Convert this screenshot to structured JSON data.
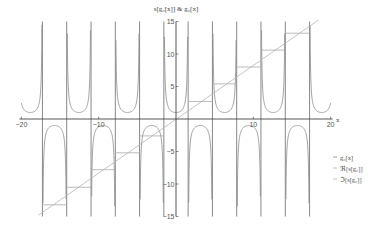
{
  "chart_data": {
    "type": "line",
    "title": "s[g₀[x]] & g₀[x]",
    "xlabel": "x",
    "ylabel": "s[g₀[x]] & g₀[x]",
    "xlim": [
      -20,
      20
    ],
    "ylim": [
      -15,
      15
    ],
    "x_ticks": [
      -20,
      -10,
      10,
      20
    ],
    "x_tick_labels": [
      "−20",
      "−10",
      "10",
      "20"
    ],
    "y_ticks": [
      15,
      10,
      5,
      -5,
      -10,
      -15
    ],
    "y_tick_labels": [
      "15",
      "10",
      "5",
      "−5",
      "−10",
      "−15"
    ],
    "grid": false,
    "legend_position": "right-middle",
    "series": [
      {
        "name": "g₀[x]",
        "description": "sec-like curve with vertical asymptotes at x = π/2 + kπ; alternating U (min ≈ 1) and inverted U (max ≈ -1)",
        "asymptotes": [
          -17.28,
          -14.14,
          -10.99,
          -7.85,
          -4.71,
          -1.57,
          1.57,
          4.71,
          7.85,
          10.99,
          14.14,
          17.28
        ],
        "extrema": [
          {
            "x": -18.85,
            "y": 1
          },
          {
            "x": -15.71,
            "y": -1
          },
          {
            "x": -12.57,
            "y": 1
          },
          {
            "x": -9.42,
            "y": -1
          },
          {
            "x": -6.28,
            "y": 1
          },
          {
            "x": -3.14,
            "y": -1
          },
          {
            "x": 0,
            "y": 1
          },
          {
            "x": 3.14,
            "y": -1
          },
          {
            "x": 6.28,
            "y": 1
          },
          {
            "x": 9.42,
            "y": -1
          },
          {
            "x": 12.57,
            "y": 1
          },
          {
            "x": 15.71,
            "y": -1
          },
          {
            "x": 18.85,
            "y": 1
          }
        ]
      },
      {
        "name": "ℜ[s[g₀]]",
        "description": "staircase, constant between consecutive asymptotes",
        "steps": [
          {
            "x0": -17.28,
            "x1": -14.14,
            "y": -13.2
          },
          {
            "x0": -14.14,
            "x1": -10.99,
            "y": -10.5
          },
          {
            "x0": -10.99,
            "x1": -7.85,
            "y": -7.8
          },
          {
            "x0": -7.85,
            "x1": -4.71,
            "y": -5.2
          },
          {
            "x0": -4.71,
            "x1": -1.57,
            "y": -2.6
          },
          {
            "x0": 1.57,
            "x1": 4.71,
            "y": 2.7
          },
          {
            "x0": 4.71,
            "x1": 7.85,
            "y": 5.4
          },
          {
            "x0": 7.85,
            "x1": 10.99,
            "y": 8.0
          },
          {
            "x0": 10.99,
            "x1": 14.14,
            "y": 10.6
          },
          {
            "x0": 14.14,
            "x1": 17.28,
            "y": 13.2
          }
        ]
      },
      {
        "name": "ℑ[s[g₀]]",
        "description": "approximately linear diagonal",
        "x": [
          -17.8,
          18.4
        ],
        "y": [
          -14.8,
          15.2
        ]
      }
    ]
  },
  "legend": {
    "items": [
      "g₀[x]",
      "ℜ[s[g₀]]",
      "ℑ[s[g₀]]"
    ]
  },
  "colors": {
    "axis": "#444444",
    "curve": "#8a8a8a",
    "asymptote": "#555555",
    "steps": "#aaaaaa",
    "diagonal": "#b5b5b5"
  }
}
